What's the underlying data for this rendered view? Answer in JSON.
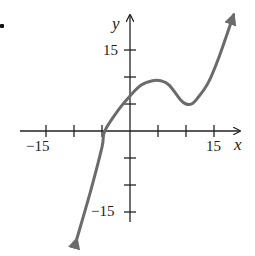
{
  "problem_marker": "•",
  "chart_data": {
    "type": "line",
    "title": "",
    "xlabel": "x",
    "ylabel": "y",
    "xlim": [
      -17,
      19
    ],
    "ylim": [
      -17,
      20
    ],
    "grid": false,
    "legend": null,
    "x_tick_step": 5,
    "y_tick_step": 5,
    "x_tick_labels": [
      {
        "value": -15,
        "label": "−15"
      },
      {
        "value": 15,
        "label": "15"
      }
    ],
    "y_tick_labels": [
      {
        "value": 15,
        "label": "15"
      },
      {
        "value": -15,
        "label": "−15"
      }
    ],
    "series": [
      {
        "name": "f(x)",
        "description": "cubic-like curve with local max near (5.5, 9) and local min near (11, 5); arrows at both ends",
        "color": "#6b6b6b",
        "arrows": "both",
        "x": [
          -9.5,
          -7,
          -5,
          -4.5,
          -2,
          0,
          2,
          4,
          5.5,
          7,
          9,
          10,
          11,
          12,
          14,
          16,
          18.5
        ],
        "y": [
          -20,
          -11,
          -3,
          0,
          4,
          6.5,
          8.5,
          9.3,
          9.3,
          8.5,
          5.8,
          5,
          5,
          6,
          9,
          14,
          21.5
        ]
      }
    ]
  },
  "labels": {
    "x_axis": "x",
    "y_axis": "y",
    "x_min": "−15",
    "x_max": "15",
    "y_max": "15",
    "y_min": "−15"
  }
}
